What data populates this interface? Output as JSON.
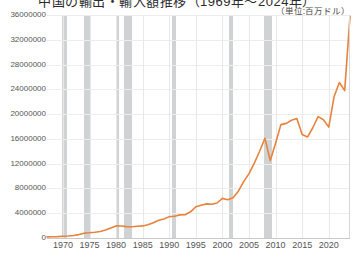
{
  "chart_data": {
    "type": "line",
    "title": "中国の輸出・輸入額推移（1969年～2024年）",
    "unit_note": "（単位:百万ドル）",
    "xlabel": "",
    "ylabel": "",
    "xlim": [
      1967,
      2024
    ],
    "ylim": [
      0,
      36000000
    ],
    "grid": true,
    "legend": "none",
    "y_ticks": [
      "0",
      "4000000",
      "8000000",
      "12000000",
      "16000000",
      "20000000",
      "24000000",
      "28000000",
      "32000000",
      "36000000"
    ],
    "y_tick_values": [
      0,
      4000000,
      8000000,
      12000000,
      16000000,
      20000000,
      24000000,
      28000000,
      32000000,
      36000000
    ],
    "x_ticks": [
      "1970",
      "1975",
      "1980",
      "1985",
      "1990",
      "1995",
      "2000",
      "2005",
      "2010",
      "2015",
      "2020"
    ],
    "x_tick_values": [
      1970,
      1975,
      1980,
      1985,
      1990,
      1995,
      2000,
      2005,
      2010,
      2015,
      2020
    ],
    "series": [
      {
        "name": "世界貿易額",
        "color": "#E8823C",
        "x": [
          1967,
          1968,
          1969,
          1970,
          1971,
          1972,
          1973,
          1974,
          1975,
          1976,
          1977,
          1978,
          1979,
          1980,
          1981,
          1982,
          1983,
          1984,
          1985,
          1986,
          1987,
          1988,
          1989,
          1990,
          1991,
          1992,
          1993,
          1994,
          1995,
          1996,
          1997,
          1998,
          1999,
          2000,
          2001,
          2002,
          2003,
          2004,
          2005,
          2006,
          2007,
          2008,
          2009,
          2010,
          2011,
          2012,
          2013,
          2014,
          2015,
          2016,
          2017,
          2018,
          2019,
          2020,
          2021,
          2022,
          2023,
          2024
        ],
        "values": [
          180000,
          200000,
          230000,
          280000,
          320000,
          400000,
          550000,
          780000,
          840000,
          930000,
          1060000,
          1280000,
          1620000,
          1950000,
          1930000,
          1830000,
          1820000,
          1900000,
          1950000,
          2130000,
          2480000,
          2850000,
          3070000,
          3450000,
          3520000,
          3730000,
          3750000,
          4230000,
          5050000,
          5290000,
          5510000,
          5440000,
          5650000,
          6400000,
          6180000,
          6500000,
          7550000,
          9110000,
          10400000,
          12100000,
          14000000,
          16100000,
          12500000,
          15300000,
          18300000,
          18500000,
          19000000,
          19300000,
          16700000,
          16300000,
          17800000,
          19600000,
          19100000,
          17900000,
          22800000,
          25100000,
          23800000,
          35800000
        ]
      }
    ],
    "recession_bands": [
      {
        "label": "1969-1970",
        "start": 1969.9,
        "end": 1970.8
      },
      {
        "label": "1973-1975",
        "start": 1973.9,
        "end": 1975.2
      },
      {
        "label": "1980",
        "start": 1980.1,
        "end": 1980.6
      },
      {
        "label": "1981-1982",
        "start": 1981.5,
        "end": 1982.9
      },
      {
        "label": "1990-1991",
        "start": 1990.5,
        "end": 1991.2
      },
      {
        "label": "2001",
        "start": 2001.2,
        "end": 2001.9
      },
      {
        "label": "2008-2009",
        "start": 2007.9,
        "end": 2009.4
      }
    ],
    "colors": {
      "series": "#E8823C",
      "gridline": "#ededed",
      "axis": "#c9c9c9",
      "band": "#c8cbcd",
      "tick_text": "#555555"
    }
  }
}
